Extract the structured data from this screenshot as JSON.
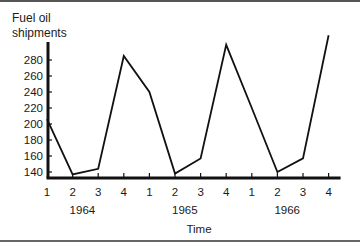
{
  "chart_data": {
    "type": "line",
    "title": "",
    "ylabel": "Fuel oil shipments",
    "ylabel_lines": [
      "Fuel oil",
      "shipments"
    ],
    "xlabel": "Time",
    "ylim": [
      130,
      310
    ],
    "yticks": [
      140,
      160,
      180,
      200,
      220,
      240,
      260,
      280
    ],
    "grid": false,
    "legend": null,
    "x": [
      "1964 Q1",
      "1964 Q2",
      "1964 Q3",
      "1964 Q4",
      "1965 Q1",
      "1965 Q2",
      "1965 Q3",
      "1965 Q4",
      "1966 Q1",
      "1966 Q2",
      "1966 Q3",
      "1966 Q4"
    ],
    "quarter_labels": [
      "1",
      "2",
      "3",
      "4",
      "1",
      "2",
      "3",
      "4",
      "1",
      "2",
      "3",
      "4"
    ],
    "year_labels": [
      "1964",
      "1965",
      "1966"
    ],
    "series": [
      {
        "name": "Fuel oil shipments",
        "values": [
          206,
          137,
          144,
          285,
          240,
          138,
          157,
          299,
          220,
          140,
          157,
          311
        ]
      }
    ]
  },
  "labels": {
    "ylabel_line1": "Fuel oil",
    "ylabel_line2": "shipments",
    "xlabel": "Time"
  }
}
